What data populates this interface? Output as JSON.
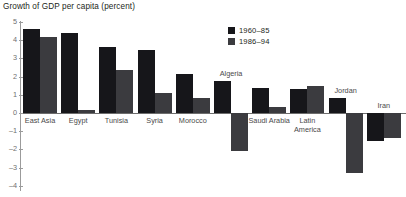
{
  "chart_data": {
    "type": "bar",
    "title": "Growth of GDP per capita (percent)",
    "xlabel": "",
    "ylabel": "",
    "ylim": [
      -4,
      5
    ],
    "yticks": [
      5,
      4,
      3,
      2,
      1,
      0,
      -1,
      -2,
      -3,
      -4
    ],
    "ytick_labels": [
      "5",
      "4",
      "3",
      "2",
      "1",
      "0",
      "–1",
      "–2",
      "–3",
      "–4"
    ],
    "grid": false,
    "legend_position": "top-center",
    "categories": [
      "East Asia",
      "Egypt",
      "Tunisia",
      "Syria",
      "Morocco",
      "Algeria",
      "Saudi Arabia",
      "Latin\nAmerica",
      "Jordan",
      "Iran"
    ],
    "series": [
      {
        "name": "1960–85",
        "color": "#16161a",
        "values": [
          4.6,
          4.4,
          3.65,
          3.45,
          2.15,
          1.75,
          1.4,
          1.3,
          0.85,
          -1.55
        ]
      },
      {
        "name": "1986–94",
        "color": "#3b3b3f",
        "values": [
          4.2,
          0.15,
          2.35,
          1.1,
          0.85,
          -2.1,
          0.35,
          1.5,
          -3.3,
          -1.4
        ]
      }
    ]
  },
  "legend": {
    "items": [
      {
        "label": "1960–85",
        "color": "#16161a"
      },
      {
        "label": "1986–94",
        "color": "#3b3b3f"
      }
    ]
  }
}
